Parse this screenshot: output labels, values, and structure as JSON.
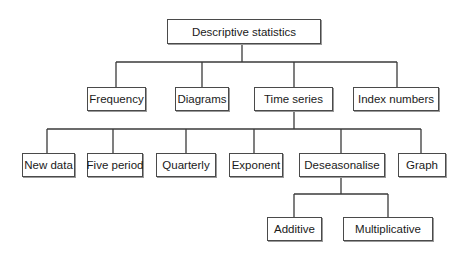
{
  "diagram": {
    "type": "tree",
    "colors": {
      "line": "#3a3a3a",
      "box_border": "#4a4a4a",
      "text": "#1a1a1a",
      "background": "#ffffff"
    },
    "root": {
      "id": "descriptive-statistics",
      "label": "Descriptive statistics"
    },
    "nodes": [
      {
        "id": "frequency",
        "label": "Frequency",
        "parent": "descriptive-statistics"
      },
      {
        "id": "diagrams",
        "label": "Diagrams",
        "parent": "descriptive-statistics"
      },
      {
        "id": "time-series",
        "label": "Time series",
        "parent": "descriptive-statistics"
      },
      {
        "id": "index-numbers",
        "label": "Index numbers",
        "parent": "descriptive-statistics"
      },
      {
        "id": "new-data",
        "label": "New data",
        "parent": "time-series"
      },
      {
        "id": "five-period",
        "label": "Five period",
        "parent": "time-series"
      },
      {
        "id": "quarterly",
        "label": "Quarterly",
        "parent": "time-series"
      },
      {
        "id": "exponent",
        "label": "Exponent",
        "parent": "time-series"
      },
      {
        "id": "deseasonalise",
        "label": "Deseasonalise",
        "parent": "time-series"
      },
      {
        "id": "graph",
        "label": "Graph",
        "parent": "time-series"
      },
      {
        "id": "additive",
        "label": "Additive",
        "parent": "deseasonalise"
      },
      {
        "id": "multiplicative",
        "label": "Multiplicative",
        "parent": "deseasonalise"
      }
    ]
  }
}
